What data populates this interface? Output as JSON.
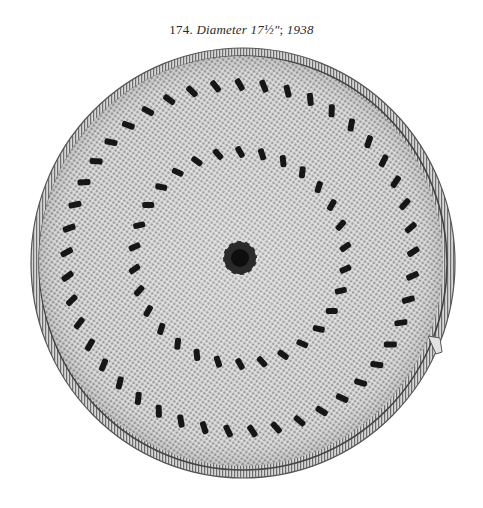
{
  "caption": {
    "number": "174.",
    "label": "Diameter",
    "diameter": "17½\"",
    "separator": ";",
    "year": "1938"
  },
  "image": {
    "subject": "coiled-basket-tray",
    "description": "Black-and-white photograph of a round coiled basket tray with two concentric rings of dark diagonal stitches and a dark center knot",
    "colors": {
      "background": "#ffffff",
      "fiber_light": "#d9d9d9",
      "fiber_mid": "#a8a8a8",
      "pattern_dark": "#1a1a1a",
      "rim": "#8c8c8c"
    }
  }
}
